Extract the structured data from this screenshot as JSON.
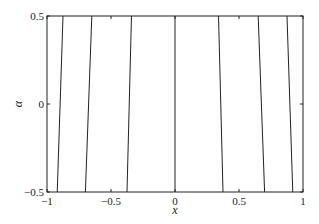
{
  "chart_data": {
    "type": "line",
    "title": "",
    "xlabel": "x",
    "ylabel": "α",
    "xlim": [
      -1,
      1
    ],
    "ylim": [
      -0.5,
      0.5
    ],
    "xticks": [
      -1,
      -0.5,
      0,
      0.5,
      1
    ],
    "xtick_labels": [
      "−1",
      "−0.5",
      "0",
      "0.5",
      "1"
    ],
    "yticks": [
      -0.5,
      0,
      0.5
    ],
    "ytick_labels": [
      "−0.5",
      "0",
      "0.5"
    ],
    "grid": false,
    "legend": null,
    "line_color": "#222222",
    "series": [
      {
        "name": "line1",
        "x": [
          -0.92,
          -0.875
        ],
        "y": [
          -0.5,
          0.5
        ]
      },
      {
        "name": "line2",
        "x": [
          -0.7,
          -0.65
        ],
        "y": [
          -0.5,
          0.5
        ]
      },
      {
        "name": "line3",
        "x": [
          -0.375,
          -0.34
        ],
        "y": [
          -0.5,
          0.5
        ]
      },
      {
        "name": "line4",
        "x": [
          0,
          0
        ],
        "y": [
          -0.5,
          0.5
        ]
      },
      {
        "name": "line5",
        "x": [
          0.375,
          0.34
        ],
        "y": [
          -0.5,
          0.5
        ]
      },
      {
        "name": "line6",
        "x": [
          0.7,
          0.65
        ],
        "y": [
          -0.5,
          0.5
        ]
      },
      {
        "name": "line7",
        "x": [
          0.92,
          0.875
        ],
        "y": [
          -0.5,
          0.5
        ]
      }
    ]
  }
}
